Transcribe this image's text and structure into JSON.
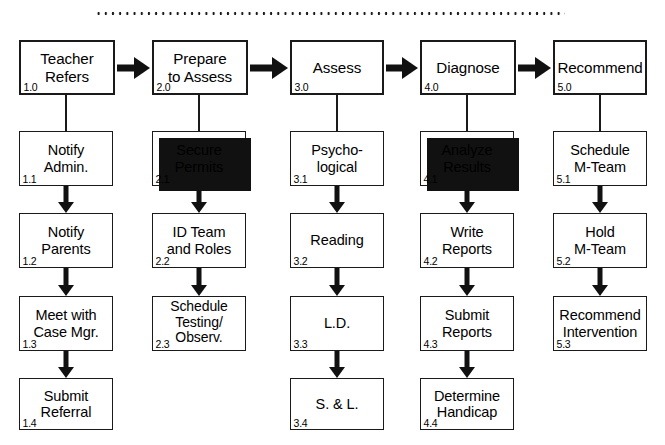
{
  "diagram": {
    "top_rule": {
      "style": "dotted",
      "color": "#1a1a1a"
    },
    "columns": [
      {
        "id": "col-1",
        "header": {
          "label": "Teacher\nRefers",
          "number": "1.0",
          "shadow": false
        },
        "steps": [
          {
            "label": "Notify\nAdmin.",
            "number": "1.1",
            "shadow": false
          },
          {
            "label": "Notify\nParents",
            "number": "1.2",
            "shadow": false
          },
          {
            "label": "Meet with\nCase Mgr.",
            "number": "1.3",
            "shadow": false
          },
          {
            "label": "Submit\nReferral",
            "number": "1.4",
            "shadow": false
          }
        ]
      },
      {
        "id": "col-2",
        "header": {
          "label": "Prepare\nto Assess",
          "number": "2.0",
          "shadow": false
        },
        "steps": [
          {
            "label": "Secure\nPermits",
            "number": "2.1",
            "shadow": true
          },
          {
            "label": "ID Team\nand Roles",
            "number": "2.2",
            "shadow": false
          },
          {
            "label": "Schedule\nTesting/\nObserv.",
            "number": "2.3",
            "shadow": false,
            "lines": 3
          }
        ]
      },
      {
        "id": "col-3",
        "header": {
          "label": "Assess",
          "number": "3.0",
          "shadow": false
        },
        "steps": [
          {
            "label": "Psycho-\nlogical",
            "number": "3.1",
            "shadow": false
          },
          {
            "label": "Reading",
            "number": "3.2",
            "shadow": false
          },
          {
            "label": "L.D.",
            "number": "3.3",
            "shadow": false
          },
          {
            "label": "S. & L.",
            "number": "3.4",
            "shadow": false
          }
        ]
      },
      {
        "id": "col-4",
        "header": {
          "label": "Diagnose",
          "number": "4.0",
          "shadow": false
        },
        "steps": [
          {
            "label": "Analyze\nResults",
            "number": "4.1",
            "shadow": true
          },
          {
            "label": "Write\nReports",
            "number": "4.2",
            "shadow": false
          },
          {
            "label": "Submit\nReports",
            "number": "4.3",
            "shadow": false
          },
          {
            "label": "Determine\nHandicap",
            "number": "4.4",
            "shadow": false
          }
        ]
      },
      {
        "id": "col-5",
        "header": {
          "label": "Recommend",
          "number": "5.0",
          "shadow": false
        },
        "steps": [
          {
            "label": "Schedule\nM-Team",
            "number": "5.1",
            "shadow": false
          },
          {
            "label": "Hold\nM-Team",
            "number": "5.2",
            "shadow": false
          },
          {
            "label": "Recommend\nIntervention",
            "number": "5.3",
            "shadow": false
          }
        ]
      }
    ],
    "colors": {
      "line": "#1a1a1a",
      "fill": "#ffffff",
      "shadow": "#111111"
    }
  }
}
